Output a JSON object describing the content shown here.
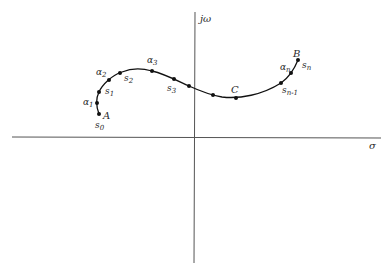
{
  "diagram": {
    "axes": {
      "horizontal_label": "σ",
      "vertical_label": "jω",
      "color": "#555555"
    },
    "curve_color": "#111111",
    "points": [
      {
        "id": "s0",
        "x": 99,
        "y": 114
      },
      {
        "id": "alpha1",
        "x": 97,
        "y": 103
      },
      {
        "id": "s1",
        "x": 99,
        "y": 92
      },
      {
        "id": "alpha2",
        "x": 109,
        "y": 80
      },
      {
        "id": "s2",
        "x": 120,
        "y": 73
      },
      {
        "id": "alpha3",
        "x": 152,
        "y": 71
      },
      {
        "id": "s3",
        "x": 174,
        "y": 79
      },
      {
        "id": "p8",
        "x": 189,
        "y": 86
      },
      {
        "id": "p9",
        "x": 213,
        "y": 95
      },
      {
        "id": "C",
        "x": 236,
        "y": 98
      },
      {
        "id": "s_n_minus_1",
        "x": 281,
        "y": 83
      },
      {
        "id": "alpha_n",
        "x": 291,
        "y": 73
      },
      {
        "id": "s_n",
        "x": 298,
        "y": 60
      }
    ],
    "labels": {
      "A": "A",
      "B": "B",
      "C": "C",
      "s": "s",
      "alpha": "α",
      "sub_0": "0",
      "sub_1": "1",
      "sub_2": "2",
      "sub_3": "3",
      "sub_n": "n",
      "sub_n_minus_1": "n-1"
    }
  }
}
